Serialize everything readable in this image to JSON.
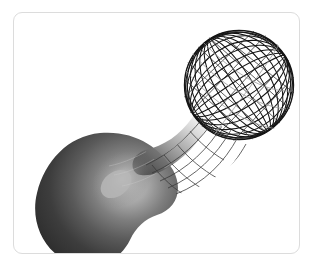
{
  "figure": {
    "title": "Dumbbell surface of revolution",
    "frame": {
      "border_color": "#dcdcdc",
      "background_color": "#ffffff",
      "corner_radius": 9,
      "x": 13,
      "y": 12,
      "width": 287,
      "height": 242
    },
    "render": {
      "shaded_lobe": {
        "label": "shaded-lobe",
        "position": "lower-left",
        "fill_dark": "#2b2b2b",
        "fill_mid": "#555555",
        "highlight": "#b8b8b8",
        "center_x": 82,
        "center_y": 185,
        "radius_x": 62,
        "radius_y": 62
      },
      "wireframe_lobe": {
        "label": "wireframe-lobe",
        "position": "upper-right",
        "stroke": "#111111",
        "stroke_light": "#8a8a8a",
        "center_x": 225,
        "center_y": 72,
        "radius_x": 55,
        "radius_y": 55,
        "meridian_count": 16,
        "parallel_count": 12
      },
      "neck": {
        "label": "neck",
        "min_width": 22,
        "axis_angle_deg": -40
      }
    },
    "icons": {
      "figure_icon": "surface-plot-icon"
    }
  }
}
